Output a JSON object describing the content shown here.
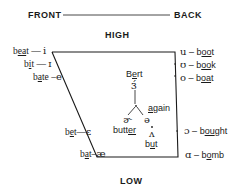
{
  "header": {
    "front": "FRONT",
    "back": "BACK",
    "high": "HIGH",
    "low": "LOW"
  },
  "front_vowels": [
    {
      "word_pre": "b",
      "word_u": "ea",
      "word_post": "t",
      "dash": " — ",
      "symbol": "i"
    },
    {
      "word_pre": "b",
      "word_u": "i",
      "word_post": "t",
      "dash": " — ",
      "symbol": "ɪ"
    },
    {
      "word_pre": "b",
      "word_u": "a",
      "word_post": "te",
      "dash": " –",
      "symbol": "e"
    },
    {
      "word_pre": "b",
      "word_u": "e",
      "word_post": "t",
      "dash": "—",
      "symbol": "ɛ"
    },
    {
      "word_pre": "b",
      "word_u": "a",
      "word_post": "t",
      "dash": "–",
      "symbol": "æ"
    }
  ],
  "back_vowels": [
    {
      "symbol": "u",
      "dash": " – ",
      "word_pre": "b",
      "word_u": "oo",
      "word_post": "t"
    },
    {
      "symbol": "ʊ",
      "dash": " – ",
      "word_pre": "b",
      "word_u": "oo",
      "word_post": "k"
    },
    {
      "symbol": "o",
      "dash": " – ",
      "word_pre": "b",
      "word_u": "oa",
      "word_post": "t"
    },
    {
      "symbol": "ɔ",
      "dash": " – ",
      "word_pre": "b",
      "word_u": "ou",
      "word_post": "ght"
    },
    {
      "symbol": "ɑ",
      "dash": " – ",
      "word_pre": "b",
      "word_u": "o",
      "word_post": "mb"
    }
  ],
  "central_vowels": {
    "bert": {
      "word_pre": "B",
      "word_u": "e",
      "word_post": "rt",
      "symbol": "ɜ́"
    },
    "butter": {
      "symbol": "ɚ",
      "word_pre": "butt",
      "word_u": "er",
      "word_post": ""
    },
    "again": {
      "symbol": "ə",
      "word_pre": "",
      "word_u": "a",
      "word_post": "gain"
    },
    "but": {
      "symbol": "ʌ",
      "word_pre": "b",
      "word_u": "u",
      "word_post": "t"
    }
  },
  "colors": {
    "ink": "#1a1a1a",
    "background": "#ffffff"
  }
}
